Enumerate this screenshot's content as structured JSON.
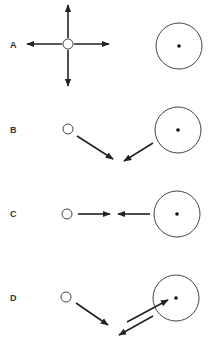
{
  "panels": [
    {
      "label": "A",
      "label_pos": [
        10,
        48
      ],
      "small_circle": {
        "cx": 68,
        "cy": 44,
        "r": 5
      },
      "large_circle": {
        "cx": 179,
        "cy": 46,
        "r": 23
      },
      "arrows": [
        {
          "x1": 68,
          "y1": 38,
          "x2": 68,
          "y2": 5
        },
        {
          "x1": 68,
          "y1": 50,
          "x2": 68,
          "y2": 86
        },
        {
          "x1": 62,
          "y1": 44,
          "x2": 27,
          "y2": 44
        },
        {
          "x1": 74,
          "y1": 44,
          "x2": 109,
          "y2": 44
        }
      ]
    },
    {
      "label": "B",
      "label_pos": [
        10,
        133
      ],
      "small_circle": {
        "cx": 68,
        "cy": 129,
        "r": 5
      },
      "large_circle": {
        "cx": 178,
        "cy": 130,
        "r": 23
      },
      "arrows": [
        {
          "x1": 77,
          "y1": 136,
          "x2": 113,
          "y2": 159
        },
        {
          "x1": 153,
          "y1": 143,
          "x2": 124,
          "y2": 161
        }
      ]
    },
    {
      "label": "C",
      "label_pos": [
        10,
        217
      ],
      "small_circle": {
        "cx": 67,
        "cy": 214,
        "r": 5
      },
      "large_circle": {
        "cx": 177,
        "cy": 214,
        "r": 23
      },
      "arrows": [
        {
          "x1": 78,
          "y1": 214,
          "x2": 110,
          "y2": 214
        },
        {
          "x1": 150,
          "y1": 214,
          "x2": 118,
          "y2": 214
        }
      ]
    },
    {
      "label": "D",
      "label_pos": [
        10,
        301
      ],
      "small_circle": {
        "cx": 66,
        "cy": 297,
        "r": 5
      },
      "large_circle": {
        "cx": 176,
        "cy": 298,
        "r": 23
      },
      "arrows": [
        {
          "x1": 76,
          "y1": 303,
          "x2": 108,
          "y2": 325
        },
        {
          "x1": 127,
          "y1": 322,
          "x2": 168,
          "y2": 300
        },
        {
          "x1": 153,
          "y1": 316,
          "x2": 119,
          "y2": 335
        }
      ]
    }
  ]
}
